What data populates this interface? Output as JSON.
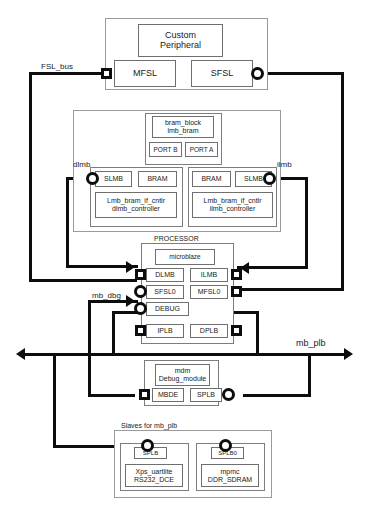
{
  "diagram": {
    "colors": {
      "wire": "#0d0d0d",
      "frame_light": "#9a9a9a",
      "frame_unit": "#6f6f6f",
      "background": "#ffffff"
    },
    "bus_labels": {
      "fsl_bus": "FSL_bus",
      "dlmb": "dlmb",
      "ilmb": "ilmb",
      "mb_dbg": "mb_dbg",
      "mb_plb": "mb_plb"
    },
    "custom_peripheral": {
      "core_line1": "Custom",
      "core_line2": "Peripheral",
      "ports": [
        {
          "label": "MFSL"
        },
        {
          "label": "SFSL"
        }
      ]
    },
    "bram_group": {
      "bram_block": {
        "line1": "bram_block",
        "line2": "lmb_bram",
        "ports": [
          {
            "label": "PORT B"
          },
          {
            "label": "PORT A"
          }
        ]
      },
      "controllers": [
        {
          "name": "dlmb-controller",
          "port_left": "SLMB",
          "port_right": "BRAM",
          "core_line1": "Lmb_bram_if_cntlr",
          "core_line2": "dlmb_controller"
        },
        {
          "name": "ilmb-controller",
          "port_left": "BRAM",
          "port_right": "SLMB",
          "core_line1": "Lmb_bram_if_cntlr",
          "core_line2": "ilmb_controller"
        }
      ]
    },
    "processor": {
      "caption": "PROCESSOR",
      "core": "microblaze",
      "ports": [
        {
          "label": "DLMB",
          "row": 1,
          "col": "left"
        },
        {
          "label": "ILMB",
          "row": 1,
          "col": "right"
        },
        {
          "label": "SFSL0",
          "row": 2,
          "col": "left"
        },
        {
          "label": "MFSL0",
          "row": 2,
          "col": "right"
        },
        {
          "label": "DEBUG",
          "row": 3,
          "col": "left"
        },
        {
          "label": "IPLB",
          "row": 4,
          "col": "left"
        },
        {
          "label": "DPLB",
          "row": 4,
          "col": "right"
        }
      ]
    },
    "mdm": {
      "core_line1": "mdm",
      "core_line2": "Debug_module",
      "ports": [
        {
          "label": "MBDE"
        },
        {
          "label": "SPLB"
        }
      ]
    },
    "slaves": {
      "caption": "Slaves for mb_plb",
      "items": [
        {
          "port": "SPLB",
          "core_line1": "Xps_uartlite",
          "core_line2": "RS232_DCE"
        },
        {
          "port": "SPLB0",
          "core_line1": "mpmc",
          "core_line2": "DDR_SDRAM"
        }
      ]
    }
  }
}
